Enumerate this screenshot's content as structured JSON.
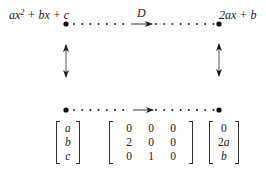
{
  "top_left_label": {
    "pre": "ax",
    "sup": "2",
    "post": " + bx + c"
  },
  "top_right_label": "2ax + b",
  "map_label": "D",
  "vector_in": [
    "a",
    "b",
    "c"
  ],
  "matrix": [
    [
      "0",
      "0",
      "0"
    ],
    [
      "2",
      "0",
      "0"
    ],
    [
      "0",
      "1",
      "0"
    ]
  ],
  "vector_out": [
    "0",
    "2a",
    "b"
  ]
}
